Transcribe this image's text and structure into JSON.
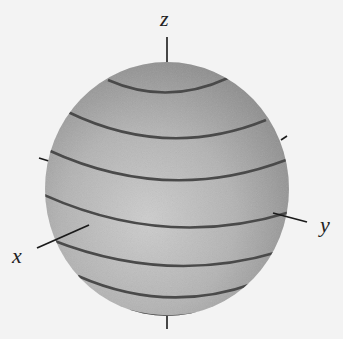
{
  "figure": {
    "axes": {
      "x": {
        "label": "x"
      },
      "y": {
        "label": "y"
      },
      "z": {
        "label": "z"
      }
    },
    "band_count": 7,
    "colors": {
      "sphere_light": "#c8c8c8",
      "sphere_dark": "#8a8a8a",
      "band": "#4a4a4a",
      "axis": "#1a1a1a",
      "background": "#f3f3f3"
    }
  }
}
